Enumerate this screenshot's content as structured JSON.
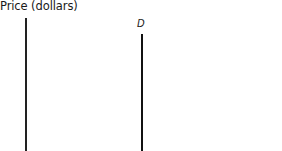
{
  "chart_data": {
    "type": "line",
    "title": "",
    "xlabel": "",
    "ylabel": "Price (dollars)",
    "series": [
      {
        "name": "D",
        "description": "Perfectly inelastic (vertical) demand curve",
        "x": [
          1,
          1
        ],
        "y": [
          0,
          1
        ]
      }
    ],
    "annotations": [
      "D"
    ],
    "grid": false,
    "legend": "none",
    "colors": {
      "axis": "#222222",
      "demand": "#111111"
    }
  },
  "labels": {
    "y_axis": "Price (dollars)",
    "curve": "D"
  }
}
